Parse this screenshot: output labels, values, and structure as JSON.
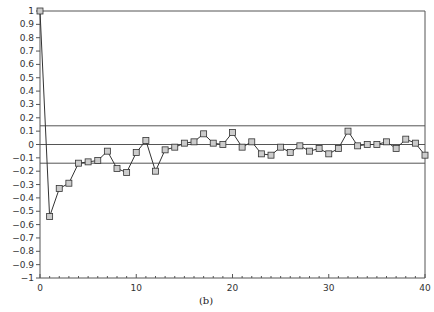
{
  "chart_data": {
    "type": "line",
    "title": "",
    "caption": "(b)",
    "xlabel": "",
    "ylabel": "",
    "xlim": [
      0,
      40
    ],
    "ylim": [
      -1,
      1
    ],
    "x_ticks": [
      0,
      10,
      20,
      30,
      40
    ],
    "y_ticks": [
      1,
      0.9,
      0.8,
      0.7,
      0.6,
      0.5,
      0.4,
      0.3,
      0.2,
      0.1,
      0,
      -0.1,
      -0.2,
      -0.3,
      -0.4,
      -0.5,
      -0.6,
      -0.7,
      -0.8,
      -0.9,
      -1
    ],
    "y_tick_labels": [
      "1",
      "0.9",
      "0.8",
      "0.7",
      "0.6",
      "0.5",
      "0.4",
      "0.3",
      "0.2",
      "0.1",
      "0",
      "−0.1",
      "−0.2",
      "−0.3",
      "−0.4",
      "−0.5",
      "−0.6",
      "−0.7",
      "−0.8",
      "−0.9",
      "−1"
    ],
    "grid": false,
    "reference_lines": [
      {
        "y": 1,
        "label": "upper frame"
      },
      {
        "y": 0.14,
        "label": "upper confidence bound"
      },
      {
        "y": 0,
        "label": "zero line"
      },
      {
        "y": -0.14,
        "label": "lower confidence bound"
      }
    ],
    "marker": "square",
    "series": [
      {
        "name": "autocorrelation",
        "x": [
          0,
          1,
          2,
          3,
          4,
          5,
          6,
          7,
          8,
          9,
          10,
          11,
          12,
          13,
          14,
          15,
          16,
          17,
          18,
          19,
          20,
          21,
          22,
          23,
          24,
          25,
          26,
          27,
          28,
          29,
          30,
          31,
          32,
          33,
          34,
          35,
          36,
          37,
          38,
          39,
          40
        ],
        "values": [
          1.0,
          -0.54,
          -0.33,
          -0.29,
          -0.14,
          -0.13,
          -0.12,
          -0.05,
          -0.18,
          -0.21,
          -0.06,
          0.03,
          -0.2,
          -0.04,
          -0.02,
          0.01,
          0.02,
          0.08,
          0.01,
          0.0,
          0.09,
          -0.02,
          0.02,
          -0.07,
          -0.08,
          -0.02,
          -0.06,
          -0.01,
          -0.05,
          -0.03,
          -0.07,
          -0.03,
          0.1,
          -0.01,
          0.0,
          0.0,
          0.02,
          -0.03,
          0.04,
          0.01,
          -0.08
        ]
      }
    ],
    "colors": {
      "line": "#333333",
      "marker_fill": "#cccccc",
      "frame": "#555555"
    }
  }
}
